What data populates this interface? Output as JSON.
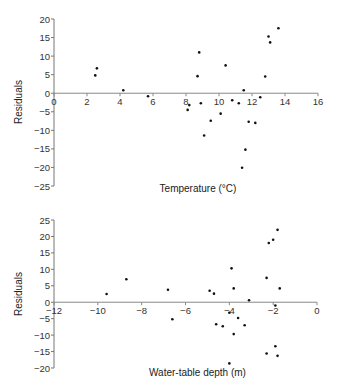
{
  "chart_data": [
    {
      "type": "scatter",
      "title": "",
      "xlabel": "Temperature (°C)",
      "ylabel": "Residuals",
      "xlim": [
        0,
        16
      ],
      "ylim": [
        -25,
        20
      ],
      "xticks": [
        0,
        2,
        4,
        6,
        8,
        10,
        12,
        14,
        16
      ],
      "yticks": [
        20,
        15,
        10,
        5,
        0,
        -5,
        -10,
        -15,
        -20,
        -25
      ],
      "grid": false,
      "legend": null,
      "points": [
        [
          2.5,
          4.8
        ],
        [
          2.6,
          6.7
        ],
        [
          4.2,
          0.8
        ],
        [
          5.7,
          -0.8
        ],
        [
          8.8,
          11.0
        ],
        [
          8.7,
          4.6
        ],
        [
          10.4,
          7.5
        ],
        [
          11.5,
          0.8
        ],
        [
          10.8,
          -1.9
        ],
        [
          11.2,
          -2.7
        ],
        [
          12.5,
          -1.1
        ],
        [
          8.9,
          -2.7
        ],
        [
          8.2,
          -3.2
        ],
        [
          8.1,
          -4.5
        ],
        [
          10.1,
          -5.5
        ],
        [
          9.5,
          -7.4
        ],
        [
          11.8,
          -7.7
        ],
        [
          12.2,
          -8.0
        ],
        [
          9.1,
          -11.4
        ],
        [
          11.6,
          -15.2
        ],
        [
          11.4,
          -20.1
        ],
        [
          12.8,
          4.5
        ],
        [
          13.0,
          15.3
        ],
        [
          13.1,
          13.7
        ],
        [
          13.6,
          17.5
        ]
      ]
    },
    {
      "type": "scatter",
      "title": "",
      "xlabel": "Water-table depth (m)",
      "ylabel": "Residuals",
      "xlim": [
        -12,
        0
      ],
      "ylim": [
        -20,
        25
      ],
      "xticks": [
        -12,
        -10,
        -8,
        -6,
        -4,
        -2,
        0
      ],
      "yticks": [
        25,
        20,
        15,
        10,
        5,
        0,
        -5,
        -10,
        -15,
        -20
      ],
      "grid": false,
      "legend": null,
      "points": [
        [
          -9.6,
          2.5
        ],
        [
          -8.7,
          7.0
        ],
        [
          -6.8,
          3.8
        ],
        [
          -6.6,
          -5.2
        ],
        [
          -1.8,
          22.0
        ],
        [
          -2.0,
          19.0
        ],
        [
          -2.2,
          18.0
        ],
        [
          -3.9,
          10.3
        ],
        [
          -2.3,
          7.4
        ],
        [
          -4.9,
          3.5
        ],
        [
          -4.7,
          2.6
        ],
        [
          -3.8,
          4.2
        ],
        [
          -1.7,
          4.2
        ],
        [
          -3.1,
          0.6
        ],
        [
          -1.9,
          -1.0
        ],
        [
          -4.0,
          -3.2
        ],
        [
          -3.6,
          -4.8
        ],
        [
          -3.3,
          -7.0
        ],
        [
          -4.6,
          -6.7
        ],
        [
          -4.3,
          -7.3
        ],
        [
          -3.8,
          -9.7
        ],
        [
          -1.9,
          -13.4
        ],
        [
          -2.3,
          -15.6
        ],
        [
          -1.8,
          -16.3
        ],
        [
          -4.0,
          -18.6
        ]
      ]
    }
  ]
}
